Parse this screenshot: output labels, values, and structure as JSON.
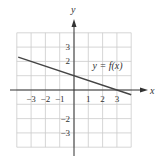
{
  "chart_data": {
    "type": "line",
    "title": "",
    "xlabel": "x",
    "ylabel": "y",
    "xlim": [
      -4,
      4
    ],
    "ylim": [
      -4,
      4
    ],
    "grid": true,
    "x_ticks": [
      {
        "value": -3,
        "label": "−3"
      },
      {
        "value": -2,
        "label": "−2"
      },
      {
        "value": -1,
        "label": "−1"
      },
      {
        "value": 1,
        "label": "1"
      },
      {
        "value": 2,
        "label": "2"
      },
      {
        "value": 3,
        "label": "3"
      }
    ],
    "y_ticks": [
      {
        "value": 3,
        "label": "3"
      },
      {
        "value": 2,
        "label": "2"
      },
      {
        "value": -2,
        "label": "−2"
      },
      {
        "value": -3,
        "label": "−3"
      }
    ],
    "series": [
      {
        "name": "y = f(x)",
        "slope": -0.3333,
        "intercept": 1,
        "x": [
          -3.9,
          4.0
        ],
        "y": [
          2.3,
          -0.333
        ]
      }
    ],
    "annotations": [
      {
        "text": "y = f(x)",
        "x": 1.3,
        "y": 1.5
      }
    ]
  },
  "colors": {
    "grid": "#cccccc",
    "axis": "#333333",
    "line": "#444444"
  }
}
